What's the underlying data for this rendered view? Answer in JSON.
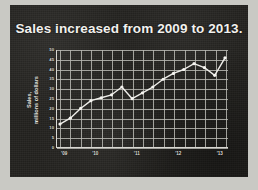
{
  "slide": {
    "title": "Sales increased from 2009 to 2013.",
    "background_color": "#23221f",
    "title_color": "#f2f1ee",
    "page_background_color": "#c9c9c4"
  },
  "chart_data": {
    "type": "line",
    "title": "Sales increased from 2009 to 2013.",
    "xlabel": "",
    "ylabel": "Sales, millions of dollars",
    "ylabel_lines": [
      "Sales,",
      "millions of dollars"
    ],
    "ylim": [
      0,
      50
    ],
    "ytick_values": [
      0,
      5,
      10,
      15,
      20,
      25,
      30,
      35,
      40,
      45,
      50
    ],
    "ytick_labels": [
      "0",
      "5",
      "10",
      "15",
      "20",
      "25",
      "30",
      "35",
      "40",
      "45",
      "50"
    ],
    "xtick_labels": [
      "'09",
      "'10",
      "'11",
      "'12",
      "'13"
    ],
    "xtick_positions": [
      0.5,
      3.5,
      7.5,
      11.5,
      15.5
    ],
    "grid": true,
    "grid_color": "#b9b8b3",
    "line_color": "#f0efeb",
    "marker_color": "#f5f4f0",
    "marker_shape": "circle",
    "x": [
      0,
      1,
      2,
      3,
      4,
      5,
      6,
      7,
      8,
      9,
      10,
      11,
      12,
      13,
      14,
      15,
      16
    ],
    "values": [
      12,
      15,
      20,
      24,
      25.5,
      27,
      31,
      25,
      28,
      31,
      35,
      38,
      40,
      43,
      41,
      37,
      46
    ],
    "series": [
      {
        "name": "Sales",
        "values": [
          12,
          15,
          20,
          24,
          25.5,
          27,
          31,
          25,
          28,
          31,
          35,
          38,
          40,
          43,
          41,
          37,
          46
        ]
      }
    ]
  }
}
